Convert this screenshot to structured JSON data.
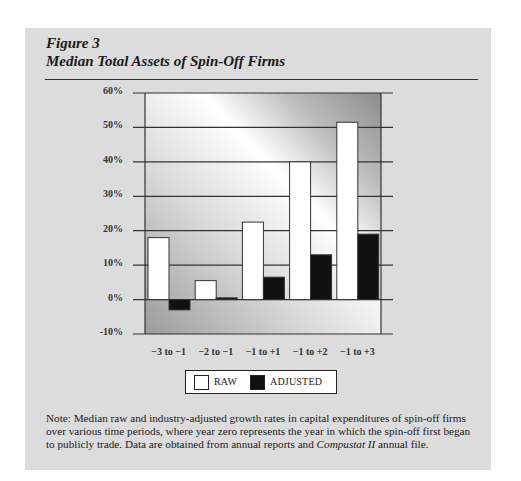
{
  "figure": {
    "label": "Figure 3",
    "title": "Median Total Assets of Spin-Off Firms"
  },
  "legend": {
    "raw_label": "RAW",
    "adjusted_label": "ADJUSTED"
  },
  "note": {
    "prefix": "Note: Median raw and industry-adjusted growth rates in capital expenditures of spin-off firms over various time periods, where year zero represents the year in which the spin-off first began to publicly trade. Data are obtained from annual reports and ",
    "italic": "Compustat II",
    "suffix": " annual file."
  },
  "colors": {
    "panel": "#dcdcdc",
    "raw": "#ffffff",
    "adjusted": "#111111",
    "axis": "#333333"
  },
  "chart_data": {
    "type": "bar",
    "title": "Median Total Assets of Spin-Off Firms",
    "xlabel": "",
    "ylabel": "",
    "categories": [
      "−3 to −1",
      "−2 to −1",
      "−1 to +1",
      "−1 to +2",
      "−1 to +3"
    ],
    "series": [
      {
        "name": "RAW",
        "values": [
          18,
          5.5,
          22.5,
          40,
          51.5
        ]
      },
      {
        "name": "ADJUSTED",
        "values": [
          -3,
          0.5,
          6.5,
          13,
          19
        ]
      }
    ],
    "yticks": [
      "60%",
      "50%",
      "40%",
      "30%",
      "20%",
      "10%",
      "0%",
      "-10%"
    ],
    "ylim": [
      -10,
      60
    ],
    "grid": true,
    "legend_position": "bottom"
  }
}
